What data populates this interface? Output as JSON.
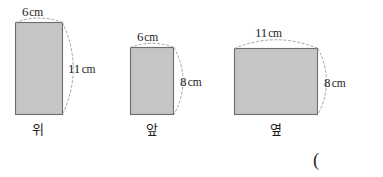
{
  "figure": {
    "background_color": "#ffffff",
    "fill_color": "#c5c5c5",
    "stroke_color": "#6d6d6d",
    "arc_color": "#9a9a9a",
    "trailing_symbol": "(",
    "shapes": [
      {
        "key": "top-view",
        "view_label": "위",
        "width_label": "6",
        "width_unit": "cm",
        "height_label": "11",
        "height_unit": "cm",
        "width_cm": 6,
        "height_cm": 11
      },
      {
        "key": "front-view",
        "view_label": "앞",
        "width_label": "6",
        "width_unit": "cm",
        "height_label": "8",
        "height_unit": "cm",
        "width_cm": 6,
        "height_cm": 8
      },
      {
        "key": "side-view",
        "view_label": "옆",
        "width_label": "11",
        "width_unit": "cm",
        "height_label": "8",
        "height_unit": "cm",
        "width_cm": 11,
        "height_cm": 8
      }
    ]
  }
}
